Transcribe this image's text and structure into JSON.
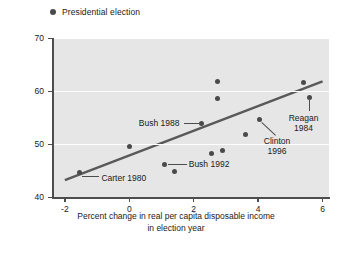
{
  "legend": {
    "label": "Presidential election",
    "marker_color": "#4a4a4a",
    "position": "top-left"
  },
  "axis": {
    "y_title": "Percentage of vote for incumbent party",
    "x_title_line1": "Percent change in real per capita disposable income",
    "x_title_line2": "in election year",
    "y_ticks": [
      "40",
      "50",
      "60",
      "70"
    ],
    "x_ticks": [
      "-2",
      "0",
      "2",
      "4",
      "6"
    ]
  },
  "chart_data": {
    "type": "scatter",
    "title": "",
    "xlabel": "Percent change in real per capita disposable income in election year",
    "ylabel": "Percentage of vote for incumbent party",
    "xlim": [
      -2.4,
      6.2
    ],
    "ylim": [
      40,
      70
    ],
    "xticks": [
      -2,
      0,
      2,
      4,
      6
    ],
    "yticks": [
      40,
      50,
      60,
      70
    ],
    "grid": "horizontal-white-on-gray",
    "plot_bgcolor": "#e6e6e6",
    "marker_color": "#4a4a4a",
    "trendline_color": "#595959",
    "legend_entries": [
      "Presidential election"
    ],
    "points": [
      {
        "x": -1.55,
        "y": 44.7,
        "label": "Carter 1980"
      },
      {
        "x": 0.0,
        "y": 49.6,
        "label": ""
      },
      {
        "x": 1.1,
        "y": 46.2,
        "label": "Bush 1992"
      },
      {
        "x": 1.4,
        "y": 44.9,
        "label": ""
      },
      {
        "x": 2.25,
        "y": 53.9,
        "label": "Bush 1988"
      },
      {
        "x": 2.55,
        "y": 48.3,
        "label": ""
      },
      {
        "x": 2.75,
        "y": 61.8,
        "label": ""
      },
      {
        "x": 2.75,
        "y": 58.6,
        "label": ""
      },
      {
        "x": 2.9,
        "y": 48.8,
        "label": ""
      },
      {
        "x": 3.6,
        "y": 51.7,
        "label": ""
      },
      {
        "x": 4.05,
        "y": 54.7,
        "label": "Clinton 1996"
      },
      {
        "x": 5.4,
        "y": 61.6,
        "label": ""
      },
      {
        "x": 5.6,
        "y": 58.8,
        "label": "Reagan 1984"
      }
    ],
    "trendline": {
      "x0": -2.0,
      "y0": 43.2,
      "x1": 6.0,
      "y1": 61.8
    },
    "annotations": [
      {
        "text": "Bush 1988",
        "lines": [
          "Bush 1988"
        ]
      },
      {
        "text": "Carter 1980",
        "lines": [
          "Carter 1980"
        ]
      },
      {
        "text": "Bush 1992",
        "lines": [
          "Bush 1992"
        ]
      },
      {
        "text": "Clinton 1996",
        "lines": [
          "Clinton",
          "1996"
        ]
      },
      {
        "text": "Reagan 1984",
        "lines": [
          "Reagan",
          "1984"
        ]
      }
    ]
  },
  "annotations": {
    "bush1988": "Bush 1988",
    "carter1980": "Carter 1980",
    "bush1992": "Bush 1992",
    "clinton_l1": "Clinton",
    "clinton_l2": "1996",
    "reagan_l1": "Reagan",
    "reagan_l2": "1984"
  }
}
